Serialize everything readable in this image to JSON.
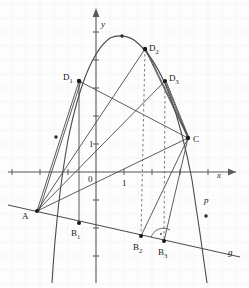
{
  "figure": {
    "width": 249,
    "height": 288,
    "background_color": "#fdfdfd",
    "grid": {
      "visible": true,
      "color": "#f0f0f2",
      "spacing_px": 14
    },
    "axes": {
      "color": "#555555",
      "origin_px": {
        "x": 96,
        "y": 172
      },
      "unit_px": 28,
      "x_axis": {
        "label": "x",
        "label_pos": {
          "x": 217,
          "y": 176
        },
        "from_px": 8,
        "to_px": 240
      },
      "y_axis": {
        "label": "y",
        "label_pos": {
          "x": 101,
          "y": 25
        },
        "from_px": 8,
        "to_px": 283
      },
      "origin_label": "0",
      "origin_label_pos": {
        "x": 88,
        "y": 180
      },
      "x_unit_label": "1",
      "x_unit_label_pos": {
        "x": 122,
        "y": 184
      },
      "y_unit_label": "1",
      "y_unit_label_pos": {
        "x": 89,
        "y": 148
      }
    },
    "curves": {
      "parabola": {
        "name": "p",
        "label": "p",
        "label_pos": {
          "x": 204,
          "y": 202
        },
        "color": "#4a4a4a"
      },
      "line_g": {
        "name": "g",
        "label": "g",
        "label_pos": {
          "x": 228,
          "y": 254
        },
        "color": "#4a4a4a"
      }
    },
    "points": [
      {
        "id": "A",
        "label": "A",
        "x": 37,
        "y": 211,
        "label_x": 24,
        "label_y": 218
      },
      {
        "id": "B1",
        "label": "B",
        "sub": "1",
        "x": 79,
        "y": 223,
        "label_x": 72,
        "label_y": 236
      },
      {
        "id": "B2",
        "label": "B",
        "sub": "2",
        "x": 141,
        "y": 236,
        "label_x": 134,
        "label_y": 250
      },
      {
        "id": "B3",
        "label": "B",
        "sub": "3",
        "x": 164,
        "y": 241,
        "label_x": 159,
        "label_y": 255
      },
      {
        "id": "C",
        "label": "C",
        "x": 188,
        "y": 138,
        "label_x": 194,
        "label_y": 141
      },
      {
        "id": "D1",
        "label": "D",
        "sub": "1",
        "x": 79,
        "y": 81,
        "label_x": 64,
        "label_y": 79
      },
      {
        "id": "D2",
        "label": "D",
        "sub": "2",
        "x": 145,
        "y": 49,
        "label_x": 150,
        "label_y": 50
      },
      {
        "id": "D3",
        "label": "D",
        "sub": "3",
        "x": 165,
        "y": 81,
        "label_x": 170,
        "label_y": 80
      }
    ],
    "marked_points": [
      {
        "name": "parabola-vertex-marker",
        "x": 122,
        "y": 36
      },
      {
        "name": "segment-midpoint-a-d1",
        "x": 56,
        "y": 137
      },
      {
        "name": "line-p-marker",
        "x": 206,
        "y": 216
      }
    ],
    "right_angle": {
      "at": "B3",
      "marker_color": "#555555",
      "note": "right angle arc at B3"
    },
    "dashed_segments": [
      {
        "name": "dashed-d2-b2",
        "from": "D2",
        "to": "B2"
      },
      {
        "name": "dashed-d3-b3",
        "from": "D3",
        "to": "B3"
      }
    ],
    "solid_segments": [
      {
        "name": "segment-a-d1"
      },
      {
        "name": "segment-a-b1"
      },
      {
        "name": "segment-d1-b1"
      },
      {
        "name": "segment-a-d2"
      },
      {
        "name": "segment-a-d3"
      },
      {
        "name": "segment-a-c"
      },
      {
        "name": "segment-d1-c"
      },
      {
        "name": "segment-d2-c"
      },
      {
        "name": "segment-d3-c"
      },
      {
        "name": "segment-b2-c"
      },
      {
        "name": "segment-b3-c"
      },
      {
        "name": "segment-a-b3-on-g"
      }
    ]
  }
}
